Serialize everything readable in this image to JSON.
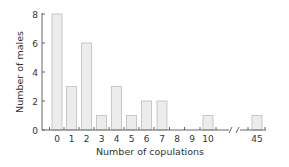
{
  "chart_data": {
    "type": "bar",
    "title": "",
    "xlabel": "Number of copulations",
    "ylabel": "Number of males",
    "categories": [
      "0",
      "1",
      "2",
      "3",
      "4",
      "5",
      "6",
      "7",
      "8",
      "9",
      "10",
      "45"
    ],
    "values": [
      8,
      3,
      6,
      1,
      3,
      1,
      2,
      2,
      0,
      0,
      1,
      1
    ],
    "ylim": [
      0,
      8
    ],
    "yticks": [
      0,
      2,
      4,
      6,
      8
    ],
    "grid": false,
    "legend": null,
    "annotations": [
      "x-axis break between 10 and 45"
    ]
  },
  "colors": {
    "bar_fill": "#ececec",
    "bar_stroke": "#bdbdbd",
    "axis": "#555555",
    "text": "#333333"
  }
}
